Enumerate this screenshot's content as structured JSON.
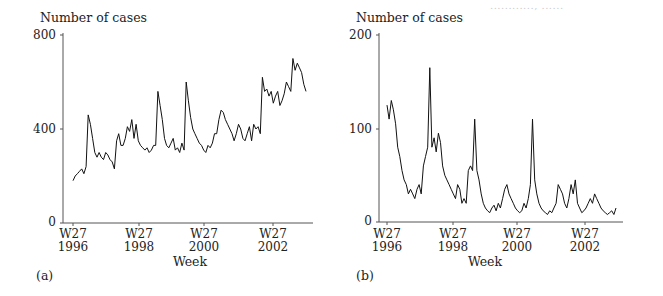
{
  "header": {
    "faint_text": "............, ......"
  },
  "chart_data": [
    {
      "type": "line",
      "panel_label": "(a)",
      "title": "",
      "ylabel": "Number of cases",
      "xlabel": "Week",
      "ylim": [
        0,
        800
      ],
      "yticks": [
        0,
        400,
        800
      ],
      "xticks": [
        {
          "label": "W27",
          "year": "1996",
          "x_index": 0
        },
        {
          "label": "W27",
          "year": "1998",
          "x_index": 104
        },
        {
          "label": "W27",
          "year": "2000",
          "x_index": 208
        },
        {
          "label": "W27",
          "year": "2002",
          "x_index": 312
        }
      ],
      "x_start": "W27 1996",
      "x_step_weeks": 2.6,
      "grid": false,
      "values": [
        180,
        200,
        210,
        220,
        230,
        210,
        240,
        460,
        420,
        360,
        300,
        280,
        300,
        280,
        270,
        300,
        290,
        270,
        260,
        230,
        350,
        380,
        330,
        330,
        360,
        410,
        390,
        440,
        360,
        420,
        350,
        330,
        320,
        310,
        320,
        300,
        310,
        330,
        330,
        560,
        500,
        440,
        360,
        330,
        320,
        340,
        360,
        310,
        320,
        300,
        340,
        310,
        600,
        520,
        450,
        400,
        380,
        360,
        340,
        330,
        310,
        300,
        330,
        320,
        340,
        380,
        380,
        440,
        480,
        470,
        440,
        420,
        400,
        380,
        350,
        380,
        420,
        400,
        360,
        350,
        380,
        410,
        350,
        420,
        400,
        410,
        380,
        620,
        560,
        570,
        540,
        560,
        510,
        540,
        560,
        500,
        520,
        550,
        600,
        580,
        560,
        700,
        650,
        680,
        660,
        640,
        590,
        560
      ]
    },
    {
      "type": "line",
      "panel_label": "(b)",
      "title": "",
      "ylabel": "Number of cases",
      "xlabel": "Week",
      "ylim": [
        0,
        200
      ],
      "yticks": [
        0,
        100,
        200
      ],
      "xticks": [
        {
          "label": "W27",
          "year": "1996",
          "x_index": 0
        },
        {
          "label": "W27",
          "year": "1998",
          "x_index": 104
        },
        {
          "label": "W27",
          "year": "2000",
          "x_index": 208
        },
        {
          "label": "W27",
          "year": "2002",
          "x_index": 312
        }
      ],
      "x_start": "W27 1996",
      "x_step_weeks": 2.6,
      "grid": false,
      "values": [
        125,
        110,
        130,
        120,
        105,
        80,
        70,
        55,
        45,
        40,
        30,
        35,
        30,
        25,
        35,
        40,
        30,
        60,
        70,
        80,
        165,
        80,
        90,
        75,
        95,
        85,
        60,
        50,
        45,
        40,
        35,
        30,
        25,
        40,
        35,
        20,
        25,
        20,
        55,
        60,
        55,
        110,
        55,
        45,
        30,
        20,
        15,
        12,
        10,
        15,
        18,
        12,
        20,
        15,
        25,
        35,
        40,
        30,
        25,
        20,
        15,
        12,
        10,
        12,
        20,
        15,
        25,
        40,
        110,
        45,
        30,
        20,
        15,
        12,
        10,
        8,
        12,
        10,
        15,
        20,
        40,
        35,
        30,
        20,
        15,
        25,
        40,
        30,
        45,
        20,
        15,
        10,
        12,
        15,
        20,
        25,
        20,
        30,
        25,
        20,
        15,
        12,
        10,
        8,
        10,
        12,
        8,
        15
      ]
    }
  ]
}
